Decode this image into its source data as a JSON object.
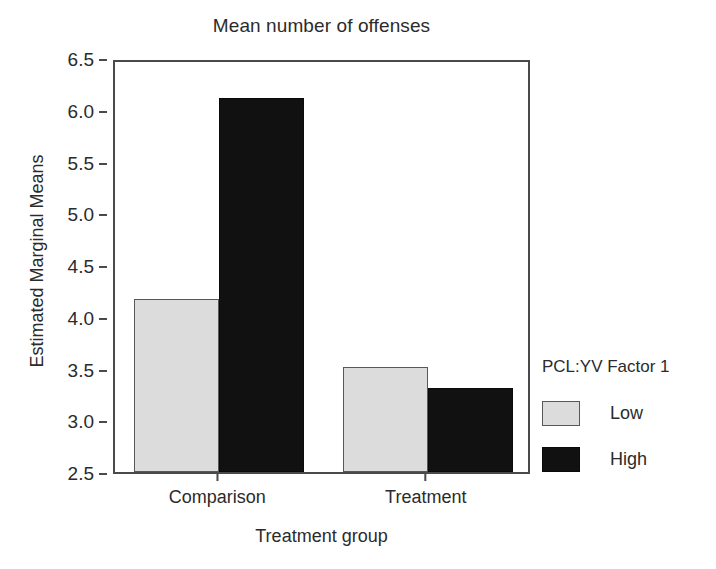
{
  "chart_data": {
    "type": "bar",
    "title": "Mean number of offenses",
    "xlabel": "Treatment group",
    "ylabel": "Estimated Marginal Means",
    "categories": [
      "Comparison",
      "Treatment"
    ],
    "series": [
      {
        "name": "Low",
        "values": [
          4.17,
          3.51
        ],
        "color": "#dcdcdc"
      },
      {
        "name": "High",
        "values": [
          6.11,
          3.31
        ],
        "color": "#111111"
      }
    ],
    "ylim": [
      2.5,
      6.5
    ],
    "yticks": [
      "2.5",
      "3.0",
      "3.5",
      "4.0",
      "4.5",
      "5.0",
      "5.5",
      "6.0",
      "6.5"
    ],
    "ytick_values": [
      2.5,
      3.0,
      3.5,
      4.0,
      4.5,
      5.0,
      5.5,
      6.0,
      6.5
    ],
    "grid": false,
    "legend": {
      "title": "PCL:YV Factor 1",
      "position": "right",
      "entries": [
        {
          "label": "Low",
          "color": "#dcdcdc"
        },
        {
          "label": "High",
          "color": "#111111"
        }
      ]
    }
  }
}
